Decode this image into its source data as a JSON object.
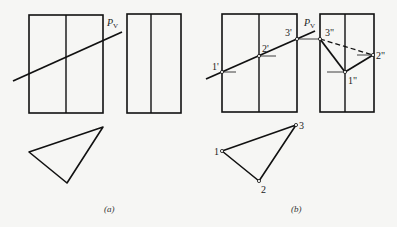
{
  "figure": {
    "panel_a": {
      "caption": "(a)",
      "trace_label": "P",
      "trace_subscript": "V",
      "front_view_rect": {
        "x": 29,
        "y": 15,
        "w": 74,
        "h": 98,
        "mid_x": 66
      },
      "side_view_rect": {
        "x": 127,
        "y": 14,
        "w": 54,
        "h": 99,
        "mid_x": 151
      },
      "cutting_line": {
        "x1": 13,
        "y1": 81,
        "x2": 122,
        "y2": 32
      },
      "top_view_triangle": [
        [
          29,
          152
        ],
        [
          103,
          127
        ],
        [
          67,
          183
        ]
      ]
    },
    "panel_b": {
      "caption": "(b)",
      "trace_label": "P",
      "trace_subscript": "V",
      "front_view_rect": {
        "x": 222,
        "y": 14,
        "w": 75,
        "h": 98,
        "mid_x": 259
      },
      "side_view_rect": {
        "x": 320,
        "y": 14,
        "w": 54,
        "h": 98,
        "mid_x": 345
      },
      "cutting_line": {
        "x1": 206,
        "y1": 79,
        "x2": 315,
        "y2": 31
      },
      "front_points": [
        {
          "label": "1'",
          "x": 222,
          "y": 72
        },
        {
          "label": "2'",
          "x": 259,
          "y": 56
        },
        {
          "label": "3'",
          "x": 297,
          "y": 39
        }
      ],
      "side_points": [
        {
          "label": "3\"",
          "x": 320,
          "y": 39
        },
        {
          "label": "1\"",
          "x": 345,
          "y": 72
        },
        {
          "label": "2\"",
          "x": 373,
          "y": 55
        }
      ],
      "top_points": [
        {
          "label": "1",
          "x": 222,
          "y": 151
        },
        {
          "label": "2",
          "x": 259,
          "y": 181
        },
        {
          "label": "3",
          "x": 296,
          "y": 125
        }
      ]
    }
  }
}
